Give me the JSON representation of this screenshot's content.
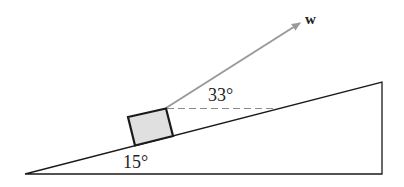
{
  "diagram": {
    "type": "inclined-plane-force",
    "incline_angle_label": "15°",
    "force_angle_label": "33°",
    "force_vector_label": "w",
    "colors": {
      "lines": "#1a1a1a",
      "arrow": "#9a9a9a",
      "block_fill": "#e0e0e0",
      "dashed": "#8a8a8a"
    }
  }
}
